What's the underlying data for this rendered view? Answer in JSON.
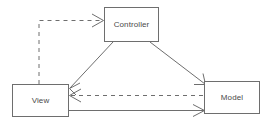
{
  "diagram": {
    "type": "mvc-triangle-diagram",
    "background_color": "#ffffff",
    "line_color": "#6e6e6e",
    "text_color": "#4a4a4a",
    "nodes": [
      {
        "id": "controller",
        "label": "Controller",
        "x": 104,
        "y": 7,
        "width": 55,
        "height": 35
      },
      {
        "id": "view",
        "label": "View",
        "x": 12,
        "y": 84,
        "width": 57,
        "height": 33
      },
      {
        "id": "model",
        "label": "Model",
        "x": 204,
        "y": 81,
        "width": 56,
        "height": 33
      }
    ],
    "edges": [
      {
        "id": "controller-to-view",
        "from": "controller",
        "to": "view",
        "style": "solid",
        "arrowhead": "open",
        "label": ""
      },
      {
        "id": "controller-to-model",
        "from": "controller",
        "to": "model",
        "style": "solid",
        "arrowhead": "open",
        "label": ""
      },
      {
        "id": "view-to-model",
        "from": "view",
        "to": "model",
        "style": "solid",
        "arrowhead": "open",
        "label": ""
      },
      {
        "id": "model-to-view",
        "from": "model",
        "to": "view",
        "style": "dashed",
        "arrowhead": "open",
        "label": ""
      },
      {
        "id": "view-to-controller",
        "from": "view",
        "to": "controller",
        "style": "dashed",
        "arrowhead": "open",
        "label": ""
      }
    ]
  }
}
